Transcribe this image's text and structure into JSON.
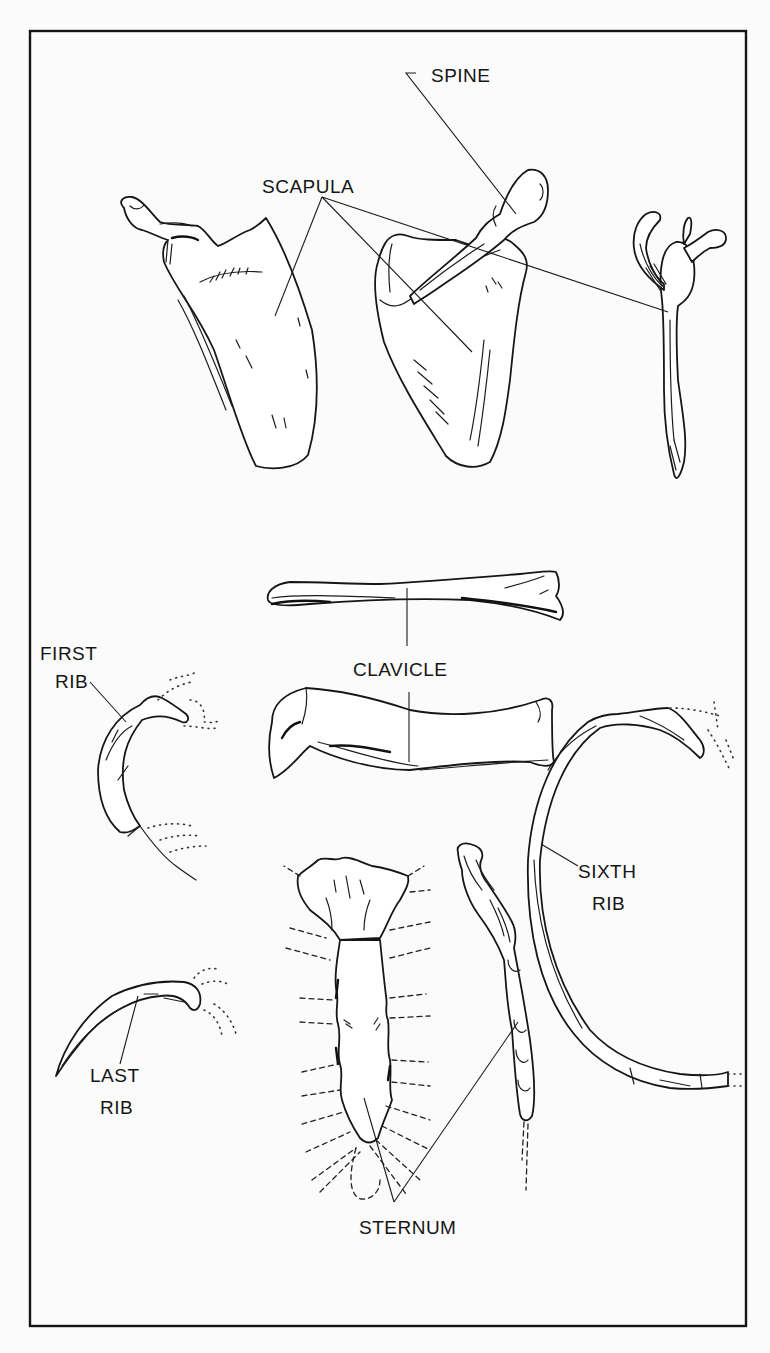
{
  "figure": {
    "frame": {
      "x": 30,
      "y": 31,
      "width": 716,
      "height": 1295,
      "stroke_color": "#141414"
    },
    "background_color": "#fbfbfb"
  },
  "labels": {
    "spine": "SPINE",
    "scapula": "SCAPULA",
    "clavicle": "CLAVICLE",
    "first_rib_line1": "FIRST",
    "first_rib_line2": "RIB",
    "sixth_rib_line1": "SIXTH",
    "sixth_rib_line2": "RIB",
    "last_rib_line1": "LAST",
    "last_rib_line2": "RIB",
    "sternum": "STERNUM"
  },
  "structures": [
    {
      "id": "scapula-dorsal-view",
      "label_ref": "scapula"
    },
    {
      "id": "scapula-ventral-view",
      "label_ref": "scapula"
    },
    {
      "id": "scapula-lateral-view",
      "label_ref": "scapula"
    },
    {
      "id": "scapular-spine",
      "label_ref": "spine"
    },
    {
      "id": "clavicle-top-view",
      "label_ref": "clavicle"
    },
    {
      "id": "clavicle-front-view",
      "label_ref": "clavicle"
    },
    {
      "id": "first-rib",
      "label_ref": "first_rib"
    },
    {
      "id": "sixth-rib",
      "label_ref": "sixth_rib"
    },
    {
      "id": "last-rib",
      "label_ref": "last_rib"
    },
    {
      "id": "sternum-ventral-view",
      "label_ref": "sternum"
    },
    {
      "id": "sternum-lateral-view",
      "label_ref": "sternum"
    }
  ]
}
